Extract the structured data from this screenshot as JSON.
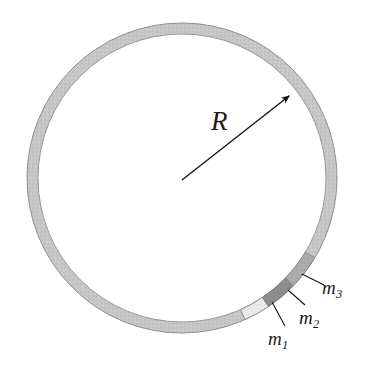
{
  "figure": {
    "type": "physics-diagram",
    "background_color": "#ffffff"
  },
  "ring": {
    "name": "ring",
    "center_x": 182,
    "center_y": 178,
    "outer_radius": 155,
    "inner_radius": 144,
    "band_thickness": 11,
    "fill_color": "#c6c6c6",
    "stroke_color": "#8f8f8f",
    "stroke_width": 1
  },
  "radius_arrow": {
    "name": "radius-arrow",
    "from_x": 182,
    "from_y": 180,
    "to_x": 289,
    "to_y": 96,
    "color": "#141414",
    "line_width": 1.4,
    "arrowhead": "filled-triangle",
    "label": "R"
  },
  "labels": {
    "radius": {
      "text": "R",
      "base": "R",
      "subscript": ""
    },
    "m1": {
      "text": "m1",
      "base": "m",
      "subscript": "1"
    },
    "m2": {
      "text": "m2",
      "base": "m",
      "subscript": "2"
    },
    "m3": {
      "text": "m3",
      "base": "m",
      "subscript": "3"
    }
  },
  "segments": [
    {
      "id": "m1",
      "label": "m1",
      "fill_color": "#e9e9e9",
      "stroke_color": "#8f8f8f",
      "start_angle_deg": 56,
      "end_angle_deg": 66,
      "leader": {
        "from_x": 272,
        "from_y": 302,
        "to_x": 285,
        "to_y": 326,
        "color": "#141414"
      }
    },
    {
      "id": "m2",
      "label": "m2",
      "fill_color": "#8d8d8d",
      "stroke_color": "#7a7a7a",
      "start_angle_deg": 44,
      "end_angle_deg": 56,
      "leader": {
        "from_x": 288,
        "from_y": 290,
        "to_x": 305,
        "to_y": 305,
        "color": "#141414"
      }
    },
    {
      "id": "m3",
      "label": "m3",
      "fill_color": "#ababab",
      "stroke_color": "#8a8a8a",
      "start_angle_deg": 31,
      "end_angle_deg": 44,
      "leader": {
        "from_x": 302,
        "from_y": 274,
        "to_x": 324,
        "to_y": 285,
        "color": "#141414"
      }
    }
  ]
}
